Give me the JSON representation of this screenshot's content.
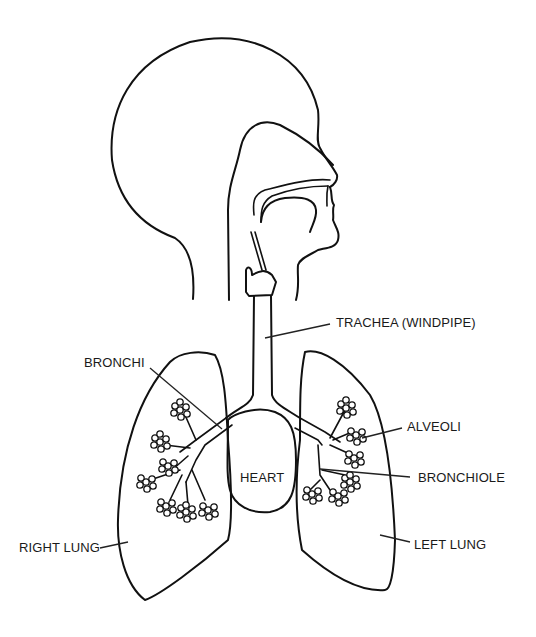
{
  "diagram": {
    "labels": {
      "trachea": "TRACHEA (WINDPIPE)",
      "bronchi": "BRONCHI",
      "alveoli": "ALVEOLI",
      "heart": "HEART",
      "bronchiole": "BRONCHIOLE",
      "right_lung": "RIGHT LUNG",
      "left_lung": "LEFT LUNG"
    },
    "colors": {
      "line": "#111111",
      "background": "#ffffff",
      "text": "#1a1a1a"
    }
  }
}
